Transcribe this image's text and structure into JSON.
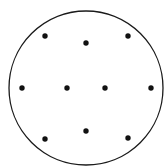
{
  "figure": {
    "title": "",
    "caption": "",
    "background_color": "#ffffff",
    "width": 167,
    "height": 168
  },
  "chart_data": {
    "type": "scatter",
    "title": "",
    "xlabel": "",
    "ylabel": "",
    "grid": false,
    "legend": null,
    "axis_visible": false,
    "xlim": [
      0,
      167
    ],
    "ylim": [
      0,
      168
    ],
    "boundary": {
      "shape": "circle",
      "center_x": 86,
      "center_y": 88,
      "radius": 77,
      "stroke_color": "#1a1a1a",
      "stroke_width": 1.3,
      "fill_color": "none"
    },
    "point_style": {
      "marker": "circle",
      "color": "#111111",
      "diameter": 5.4
    },
    "point_count": 11,
    "points": [
      {
        "id": "p1",
        "label": "top-left",
        "x": 45,
        "y": 36
      },
      {
        "id": "p2",
        "label": "top-center",
        "x": 86,
        "y": 43
      },
      {
        "id": "p3",
        "label": "top-right",
        "x": 128,
        "y": 36
      },
      {
        "id": "p4",
        "label": "middle-far-left",
        "x": 22,
        "y": 88
      },
      {
        "id": "p5",
        "label": "middle-left",
        "x": 67,
        "y": 88
      },
      {
        "id": "p6",
        "label": "middle-right",
        "x": 105,
        "y": 88
      },
      {
        "id": "p7",
        "label": "middle-far-right",
        "x": 151,
        "y": 88
      },
      {
        "id": "p8",
        "label": "bottom-left",
        "x": 45,
        "y": 139
      },
      {
        "id": "p9",
        "label": "bottom-center",
        "x": 86,
        "y": 131
      },
      {
        "id": "p10",
        "label": "bottom-right",
        "x": 128,
        "y": 138
      },
      {
        "id": "p11",
        "label": "left-lower",
        "x": 22,
        "y": 88
      }
    ]
  }
}
